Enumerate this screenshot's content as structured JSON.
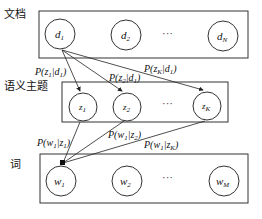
{
  "diagram": {
    "layers": [
      {
        "id": "documents",
        "label": "文档",
        "nodes": [
          {
            "base": "d",
            "sub": "1"
          },
          {
            "base": "d",
            "sub": "2"
          },
          {
            "base": "d",
            "sub": "N"
          }
        ]
      },
      {
        "id": "topics",
        "label": "语义主题",
        "nodes": [
          {
            "base": "z",
            "sub": "1"
          },
          {
            "base": "z",
            "sub": "2"
          },
          {
            "base": "z",
            "sub": "K"
          }
        ]
      },
      {
        "id": "words",
        "label": "词",
        "nodes": [
          {
            "base": "w",
            "sub": "1"
          },
          {
            "base": "w",
            "sub": "2"
          },
          {
            "base": "w",
            "sub": "M"
          }
        ]
      }
    ],
    "ellipsis": "···",
    "edges_doc_topic": [
      {
        "from": "d1",
        "to": "z1",
        "label": "P(z1|d1)",
        "p": "P(",
        "a": "z",
        "as": "1",
        "b": "d",
        "bs": "1"
      },
      {
        "from": "d1",
        "to": "z2",
        "label": "P(z2|d1)",
        "p": "P(",
        "a": "z",
        "as": "2",
        "b": "d",
        "bs": "1"
      },
      {
        "from": "d1",
        "to": "zK",
        "label": "P(zK|d1)",
        "p": "P(",
        "a": "z",
        "as": "K",
        "b": "d",
        "bs": "1"
      }
    ],
    "edges_topic_word": [
      {
        "from": "z1",
        "to": "w1",
        "label": "P(w1|z1)",
        "p": "P(",
        "a": "w",
        "as": "1",
        "b": "z",
        "bs": "1"
      },
      {
        "from": "z2",
        "to": "w1",
        "label": "P(w1|z2)",
        "p": "P(",
        "a": "w",
        "as": "1",
        "b": "z",
        "bs": "2"
      },
      {
        "from": "zK",
        "to": "w1",
        "label": "P(w1|zK)",
        "p": "P(",
        "a": "w",
        "as": "1",
        "b": "z",
        "bs": "K"
      }
    ],
    "bar": "|",
    "close": ")"
  }
}
